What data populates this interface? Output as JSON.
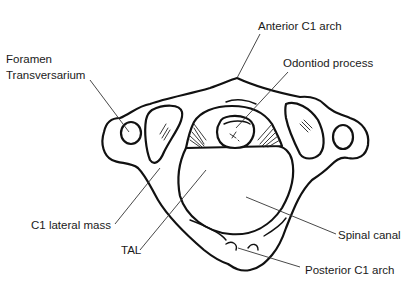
{
  "figure": {
    "colors": {
      "background": "#ffffff",
      "line": "#111111",
      "text": "#1a1a1a"
    },
    "labels": {
      "anterior_arch": "Anterior C1 arch",
      "odontoid": "Odontiod process",
      "foramen_line1": "Foramen",
      "foramen_line2": "Transversarium",
      "lateral_mass": "C1 lateral mass",
      "tal": "TAL",
      "spinal_canal": "Spinal canal",
      "posterior_arch": "Posterior C1 arch"
    }
  }
}
